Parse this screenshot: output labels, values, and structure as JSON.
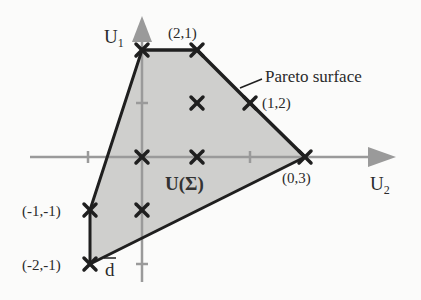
{
  "figure": {
    "type": "bargaining-set diagram",
    "axes": {
      "vertical": {
        "label": "U",
        "subscript": "1"
      },
      "horizontal": {
        "label": "U",
        "subscript": "2"
      }
    },
    "region_label": "U(Σ)",
    "pareto_label": "Pareto surface",
    "disagreement_label": "d",
    "colors": {
      "region_fill": "#cfcfcd",
      "boundary": "#1f1f1f",
      "axis": "#9a9a9a",
      "marker": "#1f1f1f",
      "background": "#fbfbfa"
    },
    "point_labels": {
      "p21": "(2,1)",
      "p12": "(1,2)",
      "p03": "(0,3)",
      "pm1m1": "(-1,-1)",
      "pm2m1": "(-2,-1)"
    },
    "points": [
      {
        "u1": 2,
        "u2": 0,
        "labeled": false
      },
      {
        "u1": 2,
        "u2": 1,
        "labeled": true,
        "label": "(2,1)"
      },
      {
        "u1": 1,
        "u2": 2,
        "labeled": true,
        "label": "(1,2)"
      },
      {
        "u1": 0,
        "u2": 3,
        "labeled": true,
        "label": "(0,3)"
      },
      {
        "u1": -1,
        "u2": -1,
        "labeled": true,
        "label": "(-1,-1)"
      },
      {
        "u1": -2,
        "u2": -1,
        "labeled": true,
        "label": "(-2,-1)"
      },
      {
        "u1": 1,
        "u2": 1,
        "labeled": false
      },
      {
        "u1": 0,
        "u2": 0,
        "labeled": false
      },
      {
        "u1": 0,
        "u2": 1,
        "labeled": false
      },
      {
        "u1": -1,
        "u2": 0,
        "labeled": false
      }
    ],
    "boundary_polygon": [
      "(2,0)",
      "(2,1)",
      "(1,2)",
      "(0,3)",
      "(-2,-1)",
      "(-1,-1)"
    ],
    "pareto_segment": [
      "(2,1)",
      "(1,2)",
      "(0,3)"
    ]
  }
}
